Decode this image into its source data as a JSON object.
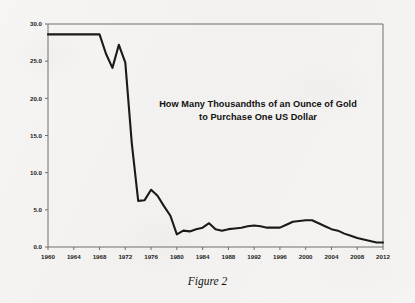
{
  "figure": {
    "caption": "Figure 2",
    "title_line_1": "How Many Thousandths of an Ounce of Gold",
    "title_line_2": "to Purchase One US Dollar"
  },
  "chart_data": {
    "type": "line",
    "title": "How Many Thousandths of an Ounce of Gold to Purchase One US Dollar",
    "xlabel": "",
    "ylabel": "",
    "xlim": [
      1960,
      2012
    ],
    "ylim": [
      0.0,
      30.0
    ],
    "grid": false,
    "legend": "none",
    "y_tick_labels": [
      "0.0",
      "5.0",
      "10.0",
      "15.0",
      "20.0",
      "25.0",
      "30.0"
    ],
    "y_tick_values": [
      0.0,
      5.0,
      10.0,
      15.0,
      20.0,
      25.0,
      30.0
    ],
    "x_tick_labels": [
      "1960",
      "1964",
      "1968",
      "1972",
      "1976",
      "1980",
      "1984",
      "1988",
      "1992",
      "1996",
      "2000",
      "2004",
      "2008",
      "2012"
    ],
    "x_tick_values": [
      1960,
      1964,
      1968,
      1972,
      1976,
      1980,
      1984,
      1988,
      1992,
      1996,
      2000,
      2004,
      2008,
      2012
    ],
    "line_color": "#1a1a1a",
    "x": [
      1960,
      1961,
      1962,
      1963,
      1964,
      1965,
      1966,
      1967,
      1968,
      1969,
      1970,
      1971,
      1972,
      1973,
      1974,
      1975,
      1976,
      1977,
      1978,
      1979,
      1980,
      1981,
      1982,
      1983,
      1984,
      1985,
      1986,
      1987,
      1988,
      1989,
      1990,
      1991,
      1992,
      1993,
      1994,
      1995,
      1996,
      1997,
      1998,
      1999,
      2000,
      2001,
      2002,
      2003,
      2004,
      2005,
      2006,
      2007,
      2008,
      2009,
      2010,
      2011,
      2012
    ],
    "values": [
      28.6,
      28.6,
      28.6,
      28.6,
      28.6,
      28.6,
      28.6,
      28.6,
      28.6,
      26.0,
      24.1,
      27.2,
      24.8,
      14.0,
      6.2,
      6.3,
      7.7,
      6.9,
      5.5,
      4.2,
      1.7,
      2.2,
      2.1,
      2.4,
      2.6,
      3.2,
      2.4,
      2.2,
      2.4,
      2.5,
      2.6,
      2.8,
      2.9,
      2.8,
      2.6,
      2.6,
      2.6,
      3.0,
      3.4,
      3.5,
      3.6,
      3.6,
      3.2,
      2.8,
      2.4,
      2.2,
      1.8,
      1.5,
      1.2,
      1.0,
      0.8,
      0.6,
      0.6
    ]
  }
}
